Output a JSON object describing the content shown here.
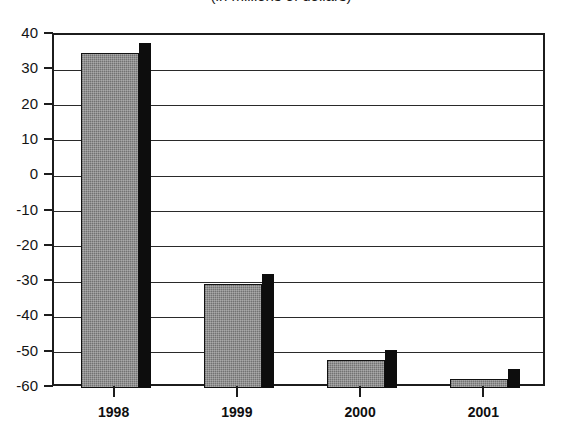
{
  "title": {
    "text": "(in millions of dollars)",
    "note": "partially cropped at top edge of screenshot"
  },
  "chart_data": {
    "type": "bar",
    "title": "(in millions of dollars)",
    "xlabel": "",
    "ylabel": "",
    "categories": [
      "1998",
      "1999",
      "2000",
      "2001"
    ],
    "values": [
      35,
      -30.5,
      -52,
      -57.5
    ],
    "ylim": [
      -60,
      40
    ],
    "ytick_values": [
      40,
      30,
      20,
      10,
      0,
      -10,
      -20,
      -30,
      -40,
      -50,
      -60
    ],
    "ytick_labels": [
      "40",
      "30",
      "20",
      "10",
      "0",
      "-10",
      "-20",
      "-30",
      "-40",
      "-50",
      "-60"
    ],
    "grid": true,
    "legend": "none",
    "baseline": -60,
    "series": [
      {
        "name": "series-1",
        "values": [
          35,
          -30.5,
          -52,
          -57.5
        ]
      }
    ],
    "style": {
      "bar_fill": "#858585",
      "bar_outline": "#111111",
      "bar_shadow": "#0d0d0d",
      "axis_color": "#1c1c1c",
      "grid_color": "#2a2a2a",
      "background": "#ffffff",
      "three_d_side": true
    }
  }
}
